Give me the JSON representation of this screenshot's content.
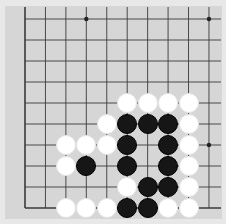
{
  "game": {
    "type": "go-board-fragment",
    "caption": "Go board position (partial view, bottom-left corner)",
    "grid": {
      "cols": 10,
      "rows": 10,
      "x0": 25,
      "y0": 19,
      "dx": 20.44,
      "dy": 21,
      "left_edge": true,
      "bottom_edge": true,
      "line_color": "#3a3a3a",
      "board_color": "#d6d6d6"
    },
    "star_points": [
      [
        3,
        0
      ],
      [
        9,
        0
      ],
      [
        9,
        6
      ]
    ],
    "stones": [
      {
        "col": 5,
        "row": 4,
        "color": "white"
      },
      {
        "col": 6,
        "row": 4,
        "color": "white"
      },
      {
        "col": 7,
        "row": 4,
        "color": "white"
      },
      {
        "col": 8,
        "row": 4,
        "color": "white"
      },
      {
        "col": 4,
        "row": 5,
        "color": "white"
      },
      {
        "col": 5,
        "row": 5,
        "color": "black"
      },
      {
        "col": 6,
        "row": 5,
        "color": "black"
      },
      {
        "col": 7,
        "row": 5,
        "color": "black"
      },
      {
        "col": 8,
        "row": 5,
        "color": "white"
      },
      {
        "col": 2,
        "row": 6,
        "color": "white"
      },
      {
        "col": 3,
        "row": 6,
        "color": "white"
      },
      {
        "col": 4,
        "row": 6,
        "color": "white"
      },
      {
        "col": 5,
        "row": 6,
        "color": "black"
      },
      {
        "col": 7,
        "row": 6,
        "color": "black"
      },
      {
        "col": 8,
        "row": 6,
        "color": "white"
      },
      {
        "col": 2,
        "row": 7,
        "color": "white"
      },
      {
        "col": 3,
        "row": 7,
        "color": "black"
      },
      {
        "col": 5,
        "row": 7,
        "color": "black"
      },
      {
        "col": 7,
        "row": 7,
        "color": "black"
      },
      {
        "col": 8,
        "row": 7,
        "color": "white"
      },
      {
        "col": 5,
        "row": 8,
        "color": "white"
      },
      {
        "col": 6,
        "row": 8,
        "color": "black"
      },
      {
        "col": 7,
        "row": 8,
        "color": "black"
      },
      {
        "col": 8,
        "row": 8,
        "color": "white"
      },
      {
        "col": 2,
        "row": 9,
        "color": "white"
      },
      {
        "col": 3,
        "row": 9,
        "color": "white"
      },
      {
        "col": 4,
        "row": 9,
        "color": "white"
      },
      {
        "col": 5,
        "row": 9,
        "color": "black"
      },
      {
        "col": 6,
        "row": 9,
        "color": "black"
      },
      {
        "col": 7,
        "row": 9,
        "color": "white"
      },
      {
        "col": 8,
        "row": 9,
        "color": "white"
      }
    ]
  }
}
